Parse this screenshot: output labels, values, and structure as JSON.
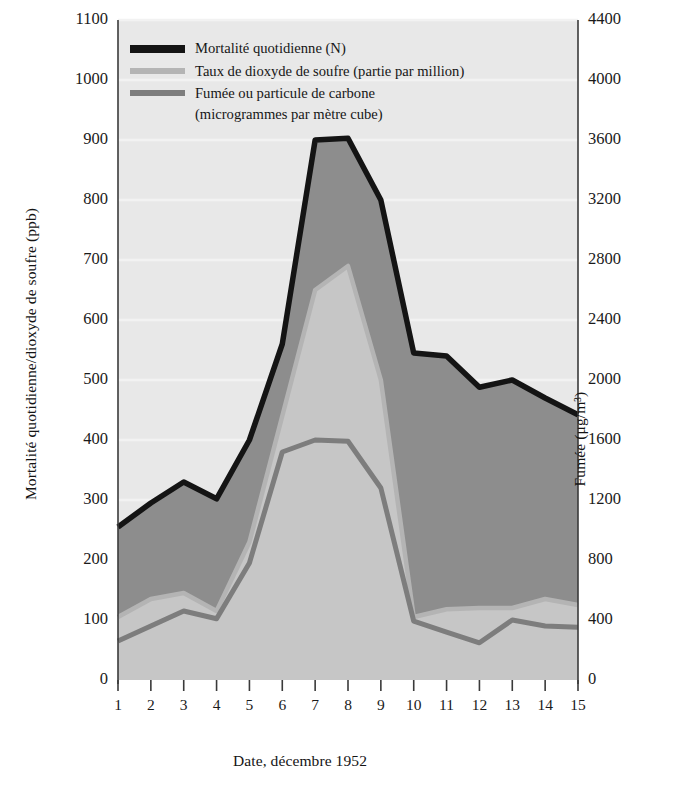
{
  "chart_data": {
    "type": "area",
    "title": "",
    "xlabel": "Date, décembre 1952",
    "ylabel": "Mortalité quotidienne/dioxyde de soufre (ppb)",
    "y2label": "Fumée (μg/m³)",
    "x": [
      1,
      2,
      3,
      4,
      5,
      6,
      7,
      8,
      9,
      10,
      11,
      12,
      13,
      14,
      15
    ],
    "xticklabels": [
      "1",
      "2",
      "3",
      "4",
      "5",
      "6",
      "7",
      "8",
      "9",
      "10",
      "11",
      "12",
      "13",
      "14",
      "15"
    ],
    "ylim": [
      0,
      1100
    ],
    "yticks": [
      0,
      100,
      200,
      300,
      400,
      500,
      600,
      700,
      800,
      900,
      1000,
      1100
    ],
    "yticklabels": [
      "0",
      "100",
      "200",
      "300",
      "400",
      "500",
      "600",
      "700",
      "800",
      "900",
      "1000",
      "1100"
    ],
    "y2lim": [
      0,
      4400
    ],
    "y2ticks": [
      0,
      400,
      800,
      1200,
      1600,
      2000,
      2400,
      2800,
      3200,
      3600,
      4000,
      4400
    ],
    "y2ticklabels": [
      "0",
      "400",
      "800",
      "1200",
      "1600",
      "2000",
      "2400",
      "2800",
      "3200",
      "3600",
      "4000",
      "4400"
    ],
    "grid": true,
    "legend_position": "top-left",
    "series": [
      {
        "name": "Mortalité quotidienne (N)",
        "axis": "left",
        "color": "#141414",
        "fill": "#8d8d8d",
        "values": [
          255,
          295,
          330,
          302,
          400,
          560,
          900,
          903,
          800,
          545,
          540,
          488,
          500,
          470,
          442
        ]
      },
      {
        "name": "Taux de dioxyde de soufre (partie par million)",
        "axis": "left",
        "color": "#b4b4b4",
        "fill": "#c8c8c8",
        "values": [
          105,
          135,
          145,
          115,
          230,
          440,
          650,
          690,
          500,
          105,
          118,
          120,
          120,
          135,
          125
        ]
      },
      {
        "name": "Fumée ou particule de carbone",
        "name_line2": "(microgrammes par mètre cube)",
        "axis": "right",
        "color": "#7d7d7d",
        "fill": "#c4c4c4",
        "values": [
          260,
          360,
          460,
          408,
          780,
          1520,
          1600,
          1592,
          1280,
          392,
          320,
          248,
          400,
          360,
          352
        ]
      }
    ]
  },
  "legend": {
    "items": [
      {
        "label": "Mortalité quotidienne (N)",
        "label2": "",
        "color": "#141414"
      },
      {
        "label": "Taux de dioxyde de soufre (partie par million)",
        "label2": "",
        "color": "#b4b4b4"
      },
      {
        "label": "Fumée ou particule de carbone",
        "label2": "(microgrammes par mètre cube)",
        "color": "#7d7d7d"
      }
    ]
  },
  "colors": {
    "plot_background": "#e8e8e8",
    "band_upper": "#8d8d8d",
    "band_lower": "#c6c6c6",
    "mortality_line": "#141414",
    "so2_line": "#b4b4b4",
    "smoke_line": "#7d7d7d",
    "gridline": "#f2f2f2",
    "axis": "#3a3a3a"
  }
}
